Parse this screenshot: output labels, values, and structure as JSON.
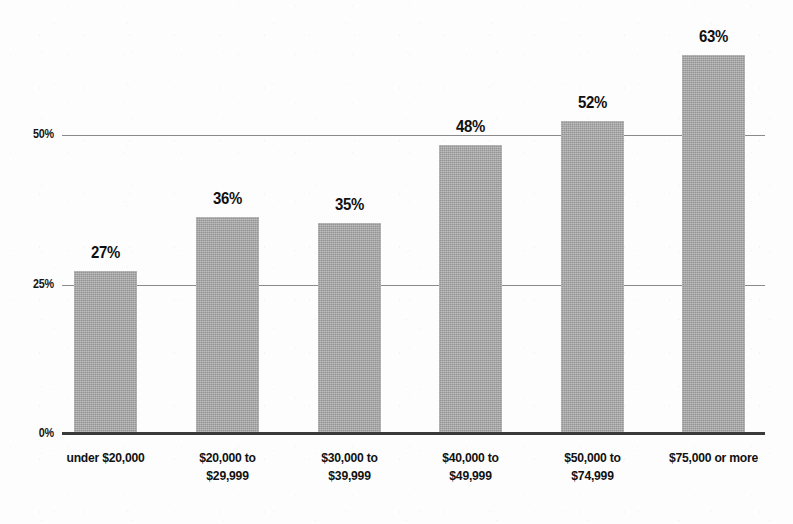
{
  "chart_data": {
    "type": "bar",
    "title": "",
    "subtitle": "",
    "xlabel": "",
    "ylabel": "",
    "categories": [
      "under $20,000",
      "$20,000 to $29,999",
      "$30,000 to $39,999",
      "$40,000 to $49,999",
      "$50,000 to $74,999",
      "$75,000 or more"
    ],
    "category_lines": [
      [
        "under $20,000"
      ],
      [
        "$20,000 to",
        "$29,999"
      ],
      [
        "$30,000 to",
        "$39,999"
      ],
      [
        "$40,000 to",
        "$49,999"
      ],
      [
        "$50,000 to",
        "$74,999"
      ],
      [
        "$75,000 or more"
      ]
    ],
    "values": [
      27,
      36,
      35,
      48,
      52,
      63
    ],
    "data_labels": [
      "27%",
      "36%",
      "35%",
      "48%",
      "52%",
      "63%"
    ],
    "ylim": [
      0,
      75
    ],
    "yticks": [
      0,
      25,
      50
    ],
    "ytick_labels": [
      "0%",
      "25%",
      "50%"
    ],
    "grid": true,
    "grid_axis": "y",
    "legend": false,
    "legend_position": "none",
    "bar_color": "#a3a3a3",
    "gridline_color": "#8a8a8a",
    "baseline_color": "#3a3a3a",
    "text_color": "#111111",
    "background_color": "#fdfdfd"
  },
  "axis": {
    "y": {
      "tick_50": "50%",
      "tick_25": "25%",
      "tick_0": "0%"
    }
  },
  "bars": [
    {
      "name": "bar-under-20000",
      "label": "27%",
      "value": 27,
      "left": 74,
      "width": 63
    },
    {
      "name": "bar-20000-29999",
      "label": "36%",
      "value": 36,
      "left": 196,
      "width": 63
    },
    {
      "name": "bar-30000-39999",
      "label": "35%",
      "value": 35,
      "left": 318,
      "width": 63
    },
    {
      "name": "bar-40000-49999",
      "label": "48%",
      "value": 48,
      "left": 439,
      "width": 63
    },
    {
      "name": "bar-50000-74999",
      "label": "52%",
      "value": 52,
      "left": 561,
      "width": 63
    },
    {
      "name": "bar-75000-or-more",
      "label": "63%",
      "value": 63,
      "left": 682,
      "width": 63
    }
  ]
}
